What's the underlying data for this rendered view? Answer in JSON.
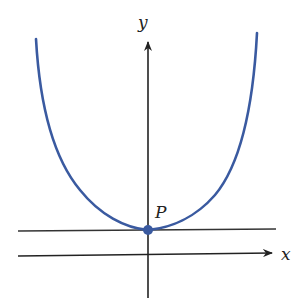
{
  "figure": {
    "labels": {
      "y_axis": "y",
      "x_axis": "x",
      "point": "P"
    },
    "colors": {
      "curve": "#3a5aa0",
      "axes": "#222222",
      "point": "#3a5aa0"
    }
  }
}
